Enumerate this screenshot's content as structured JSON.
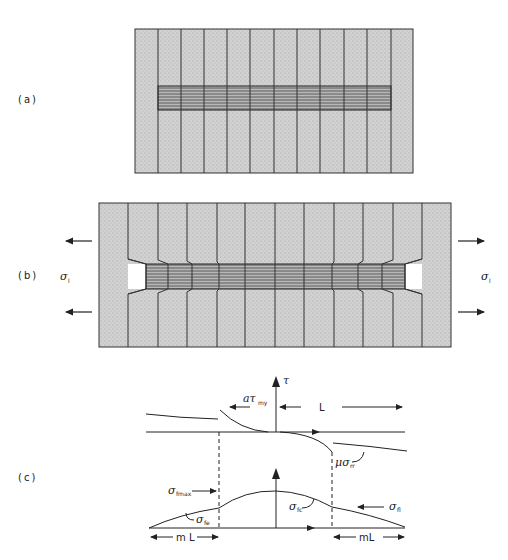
{
  "figure": {
    "panels": [
      {
        "id": "a",
        "label": "(a)"
      },
      {
        "id": "b",
        "label": "(b)",
        "stress_left": "σ",
        "stress_left_sub": "l",
        "stress_right": "σ",
        "stress_right_sub": "l"
      },
      {
        "id": "c",
        "label": "(c)"
      }
    ],
    "panel_c": {
      "axis_label": "τ",
      "shear_label": "aτ",
      "shear_label_sub": "my",
      "length_label": "L",
      "friction_label": "μσ",
      "friction_label_sub": "rr",
      "fmax_label": "σ",
      "fmax_label_sub": "fmax",
      "fe_label": "σ",
      "fe_label_sub": "fe",
      "fc_label": "σ",
      "fc_label_sub": "fc",
      "fl_label": "σ",
      "fl_label_sub": "fl",
      "ml_left": "m L",
      "ml_right": "mL"
    },
    "colors": {
      "matrix": "#c8c8c8",
      "fiber": "#9a9a9a",
      "line": "#222222",
      "background": "#ffffff"
    }
  }
}
